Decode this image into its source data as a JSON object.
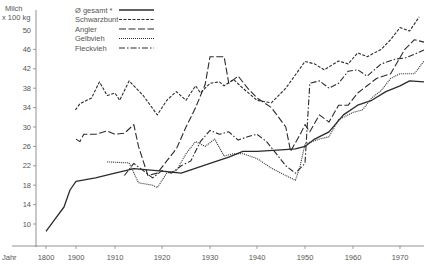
{
  "chart_data": {
    "type": "line",
    "title": "",
    "ylabel": "Milch x 100 kg",
    "ylabel_lines": [
      "Milch",
      "x 100 kg"
    ],
    "xlabel": "Jahr",
    "ylim": [
      6,
      54
    ],
    "yticks": [
      10,
      14,
      18,
      22,
      26,
      30,
      34,
      38,
      42,
      46,
      50
    ],
    "xticks": [
      1800,
      1900,
      1910,
      1920,
      1930,
      1940,
      1950,
      1960,
      1970
    ],
    "grid": false,
    "legend_position": "top-left",
    "series": [
      {
        "name": "Ø gesamt *",
        "style": "solid",
        "points": [
          [
            1800,
            8.5
          ],
          [
            1830,
            11
          ],
          [
            1860,
            13.5
          ],
          [
            1880,
            17
          ],
          [
            1900,
            18.8
          ],
          [
            1905,
            19.5
          ],
          [
            1910,
            20.5
          ],
          [
            1914,
            21.4
          ],
          [
            1920,
            20.9
          ],
          [
            1924,
            20.5
          ],
          [
            1930,
            22.5
          ],
          [
            1934,
            23.8
          ],
          [
            1937,
            25
          ],
          [
            1940,
            25
          ],
          [
            1945,
            25.3
          ],
          [
            1948,
            25.5
          ],
          [
            1950,
            26
          ],
          [
            1952,
            27.5
          ],
          [
            1955,
            29
          ],
          [
            1958,
            32.5
          ],
          [
            1961,
            34.5
          ],
          [
            1964,
            35.5
          ],
          [
            1967,
            37.3
          ],
          [
            1970,
            38.5
          ],
          [
            1972,
            39.5
          ],
          [
            1975,
            39.3
          ]
        ]
      },
      {
        "name": "Schwarzbunt",
        "style": "short-dash",
        "points": [
          [
            1898,
            33.5
          ],
          [
            1901,
            34.8
          ],
          [
            1904,
            36
          ],
          [
            1906,
            39.3
          ],
          [
            1908,
            36.5
          ],
          [
            1910,
            37
          ],
          [
            1911,
            35.5
          ],
          [
            1913,
            39.5
          ],
          [
            1916,
            36.5
          ],
          [
            1919,
            32.5
          ],
          [
            1921,
            35.5
          ],
          [
            1923,
            37.3
          ],
          [
            1925,
            35.5
          ],
          [
            1927,
            38.5
          ],
          [
            1928,
            37
          ],
          [
            1930,
            39
          ],
          [
            1932,
            39.3
          ],
          [
            1933,
            38.5
          ],
          [
            1935,
            39.8
          ],
          [
            1937,
            38
          ],
          [
            1940,
            35.5
          ],
          [
            1943,
            35
          ],
          [
            1946,
            38
          ],
          [
            1950,
            43.5
          ],
          [
            1952,
            43
          ],
          [
            1954,
            41.8
          ],
          [
            1957,
            43.6
          ],
          [
            1959,
            43
          ],
          [
            1961,
            45.3
          ],
          [
            1963,
            44.5
          ],
          [
            1966,
            46
          ],
          [
            1968,
            48
          ],
          [
            1970,
            50.5
          ],
          [
            1972,
            49.8
          ],
          [
            1974,
            52.7
          ]
        ]
      },
      {
        "name": "Angler",
        "style": "long-dash",
        "points": [
          [
            1900,
            27.5
          ],
          [
            1901,
            27
          ],
          [
            1902,
            28.5
          ],
          [
            1905,
            28.5
          ],
          [
            1908,
            29.2
          ],
          [
            1910,
            28.5
          ],
          [
            1912,
            28.7
          ],
          [
            1914,
            30.5
          ],
          [
            1915,
            26
          ],
          [
            1917,
            20
          ],
          [
            1919,
            20.5
          ],
          [
            1921,
            23
          ],
          [
            1923,
            25.5
          ],
          [
            1925,
            30
          ],
          [
            1927,
            34
          ],
          [
            1929,
            38.8
          ],
          [
            1930,
            44.5
          ],
          [
            1933,
            44.5
          ],
          [
            1934,
            39
          ],
          [
            1936,
            40.5
          ],
          [
            1938,
            38
          ],
          [
            1940,
            36
          ],
          [
            1943,
            34
          ],
          [
            1946,
            30
          ],
          [
            1947,
            25
          ],
          [
            1949,
            28.5
          ],
          [
            1950,
            30.5
          ],
          [
            1951,
            29
          ],
          [
            1953,
            32.5
          ],
          [
            1955,
            31
          ],
          [
            1957,
            34.5
          ],
          [
            1959,
            34.5
          ],
          [
            1961,
            37
          ],
          [
            1963,
            38.5
          ],
          [
            1965,
            40
          ],
          [
            1968,
            41
          ],
          [
            1971,
            46
          ],
          [
            1973,
            48
          ],
          [
            1975,
            47.5
          ]
        ]
      },
      {
        "name": "Gelbvieh",
        "style": "dotted",
        "points": [
          [
            1908,
            22.8
          ],
          [
            1913,
            22.6
          ],
          [
            1915,
            18.5
          ],
          [
            1918,
            18
          ],
          [
            1919,
            17.5
          ],
          [
            1921,
            20.5
          ],
          [
            1923,
            21
          ],
          [
            1925,
            24.5
          ],
          [
            1927,
            27
          ],
          [
            1929,
            26
          ],
          [
            1931,
            27.5
          ],
          [
            1933,
            24
          ],
          [
            1935,
            24.5
          ],
          [
            1937,
            24.5
          ],
          [
            1940,
            23.5
          ],
          [
            1943,
            21.5
          ],
          [
            1945,
            20.5
          ],
          [
            1947,
            19.5
          ],
          [
            1948,
            19
          ],
          [
            1949,
            22
          ],
          [
            1950,
            26.5
          ],
          [
            1953,
            27.5
          ],
          [
            1955,
            28
          ],
          [
            1957,
            31.5
          ],
          [
            1960,
            33
          ],
          [
            1962,
            33.5
          ],
          [
            1964,
            36
          ],
          [
            1966,
            37.5
          ],
          [
            1968,
            40
          ],
          [
            1970,
            41
          ],
          [
            1973,
            41
          ],
          [
            1975,
            43.6
          ]
        ]
      },
      {
        "name": "Fleckvieh",
        "style": "dash-dot",
        "points": [
          [
            1912,
            20
          ],
          [
            1914,
            22.5
          ],
          [
            1916,
            21
          ],
          [
            1918,
            19.5
          ],
          [
            1920,
            21
          ],
          [
            1922,
            20.5
          ],
          [
            1924,
            22
          ],
          [
            1926,
            23
          ],
          [
            1928,
            27
          ],
          [
            1930,
            29.3
          ],
          [
            1932,
            28.5
          ],
          [
            1934,
            29
          ],
          [
            1936,
            27.3
          ],
          [
            1938,
            28
          ],
          [
            1940,
            28.5
          ],
          [
            1942,
            27
          ],
          [
            1944,
            24.5
          ],
          [
            1946,
            22
          ],
          [
            1948,
            20.5
          ],
          [
            1950,
            22.5
          ],
          [
            1951,
            39
          ],
          [
            1953,
            39.5
          ],
          [
            1955,
            38
          ],
          [
            1957,
            39
          ],
          [
            1959,
            41.5
          ],
          [
            1961,
            41.8
          ],
          [
            1963,
            40.5
          ],
          [
            1966,
            43
          ],
          [
            1969,
            44
          ],
          [
            1971,
            44.2
          ],
          [
            1973,
            45
          ],
          [
            1975,
            45.9
          ]
        ]
      }
    ]
  },
  "colors": {
    "line": "#2b2b2b",
    "axis": "#777777",
    "text": "#555555"
  }
}
